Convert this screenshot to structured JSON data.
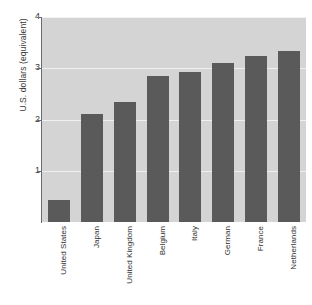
{
  "chart_data": {
    "type": "bar",
    "title": "",
    "subtitle": "",
    "xlabel": "",
    "ylabel": "U.S. dollars (equivalent)",
    "categories": [
      "United States",
      "Japan",
      "United Kingdom",
      "Belgium",
      "Italy",
      "German",
      "France",
      "Netherlands"
    ],
    "values": [
      0.42,
      2.1,
      2.35,
      2.84,
      2.92,
      3.1,
      3.24,
      3.33
    ],
    "ylim": [
      0,
      4
    ],
    "yticks": [
      1,
      2,
      3,
      4
    ],
    "ytick_labels": [
      "1",
      "2",
      "3",
      "4"
    ],
    "grid": true,
    "grid_axis": "y",
    "legend": false,
    "legend_position": "none",
    "series": [
      {
        "name": "U.S. dollars (equivalent)",
        "values": [
          0.42,
          2.1,
          2.35,
          2.84,
          2.92,
          3.1,
          3.24,
          3.33
        ]
      }
    ],
    "colors": {
      "bar_fill": "#5a5a5a",
      "plot_background": "#d4d4d4",
      "figure_background": "#ffffff",
      "gridline": "#f0f0f0",
      "axis_line": "#6b6b6b",
      "tick_label": "#3a3a3a"
    }
  }
}
